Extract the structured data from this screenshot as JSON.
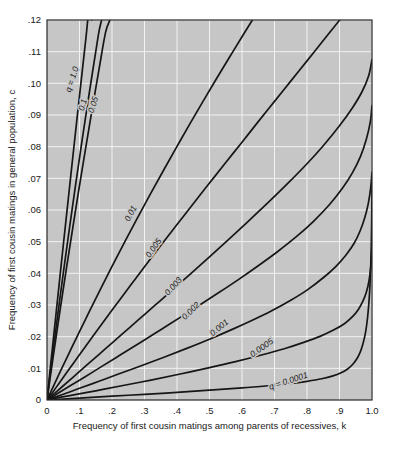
{
  "figure": {
    "title": "",
    "background_color": "#ffffff",
    "plot_background_color": "#c6c6c6",
    "gridline_color": "#f2f2f2",
    "curve_color": "#161616"
  },
  "chart_data": {
    "type": "line",
    "title": "",
    "subtitle": "",
    "xlabel": "Frequency of first cousin matings among parents of recessives, k",
    "ylabel": "Frequency of first cousin matings in general population, c",
    "xlim": [
      0,
      1.0
    ],
    "ylim": [
      0,
      0.12
    ],
    "grid": true,
    "legend_position": "inline-curve-labels",
    "x_ticks": [
      0,
      0.1,
      0.2,
      0.3,
      0.4,
      0.5,
      0.6,
      0.7,
      0.8,
      0.9,
      1.0
    ],
    "x_tick_labels": [
      "0",
      ".1",
      ".2",
      ".3",
      ".4",
      ".5",
      ".6",
      ".7",
      ".8",
      ".9",
      "1.0"
    ],
    "y_ticks": [
      0,
      0.01,
      0.02,
      0.03,
      0.04,
      0.05,
      0.06,
      0.07,
      0.08,
      0.09,
      0.1,
      0.11,
      0.12
    ],
    "y_tick_labels": [
      "0",
      ".01",
      ".02",
      ".03",
      ".04",
      ".05",
      ".06",
      ".07",
      ".08",
      ".09",
      ".10",
      ".11",
      ".12"
    ],
    "series": [
      {
        "name": "q = 1.0",
        "q": 1.0,
        "label": "q = 1.0",
        "label_x": 0.085,
        "label_y": 0.101,
        "label_rotation": -72,
        "points": [
          [
            0.0,
            0.0
          ],
          [
            0.002,
            0.00198
          ],
          [
            0.005,
            0.00495
          ],
          [
            0.01,
            0.0099
          ],
          [
            0.02,
            0.0197
          ],
          [
            0.03,
            0.0294
          ],
          [
            0.04,
            0.0391
          ],
          [
            0.05,
            0.0488
          ],
          [
            0.06,
            0.0583
          ],
          [
            0.07,
            0.0678
          ],
          [
            0.08,
            0.0773
          ],
          [
            0.09,
            0.0867
          ],
          [
            0.1,
            0.096
          ],
          [
            0.11,
            0.1053
          ],
          [
            0.12,
            0.1145
          ],
          [
            0.13,
            0.1236
          ],
          [
            0.1372,
            0.12
          ]
        ]
      },
      {
        "name": "0.1",
        "q": 0.1,
        "label": "0.1",
        "label_x": 0.118,
        "label_y": 0.093,
        "label_rotation": -74,
        "points": [
          [
            0.0,
            0.0
          ],
          [
            0.005,
            0.0042
          ],
          [
            0.01,
            0.00835
          ],
          [
            0.02,
            0.0165
          ],
          [
            0.03,
            0.0245
          ],
          [
            0.04,
            0.0323
          ],
          [
            0.05,
            0.04
          ],
          [
            0.06,
            0.0475
          ],
          [
            0.07,
            0.0549
          ],
          [
            0.08,
            0.0622
          ],
          [
            0.09,
            0.0694
          ],
          [
            0.1,
            0.0764
          ],
          [
            0.11,
            0.0834
          ],
          [
            0.12,
            0.0902
          ],
          [
            0.13,
            0.0969
          ],
          [
            0.14,
            0.1035
          ],
          [
            0.15,
            0.11
          ],
          [
            0.16,
            0.1164
          ],
          [
            0.168,
            0.12
          ]
        ]
      },
      {
        "name": "0.05",
        "q": 0.05,
        "label": "0.05",
        "label_x": 0.15,
        "label_y": 0.093,
        "label_rotation": -72,
        "points": [
          [
            0.0,
            0.0
          ],
          [
            0.005,
            0.0036
          ],
          [
            0.01,
            0.0072
          ],
          [
            0.02,
            0.0143
          ],
          [
            0.03,
            0.0213
          ],
          [
            0.04,
            0.0282
          ],
          [
            0.05,
            0.035
          ],
          [
            0.06,
            0.0417
          ],
          [
            0.07,
            0.0483
          ],
          [
            0.08,
            0.0548
          ],
          [
            0.09,
            0.0613
          ],
          [
            0.1,
            0.0677
          ],
          [
            0.12,
            0.0802
          ],
          [
            0.14,
            0.0925
          ],
          [
            0.16,
            0.1044
          ],
          [
            0.18,
            0.116
          ],
          [
            0.1935,
            0.12
          ]
        ]
      },
      {
        "name": "0.01",
        "q": 0.01,
        "label": "0.01",
        "label_x": 0.265,
        "label_y": 0.0585,
        "label_rotation": -62,
        "points": [
          [
            0.0,
            0.0
          ],
          [
            0.01,
            0.0022
          ],
          [
            0.02,
            0.0044
          ],
          [
            0.04,
            0.0088
          ],
          [
            0.06,
            0.0131
          ],
          [
            0.08,
            0.0174
          ],
          [
            0.1,
            0.0216
          ],
          [
            0.13,
            0.0279
          ],
          [
            0.16,
            0.0341
          ],
          [
            0.2,
            0.0422
          ],
          [
            0.24,
            0.0501
          ],
          [
            0.28,
            0.0578
          ],
          [
            0.32,
            0.0654
          ],
          [
            0.36,
            0.0728
          ],
          [
            0.4,
            0.0801
          ],
          [
            0.44,
            0.0873
          ],
          [
            0.48,
            0.0943
          ],
          [
            0.52,
            0.1012
          ],
          [
            0.56,
            0.108
          ],
          [
            0.6,
            0.1147
          ],
          [
            0.632,
            0.12
          ]
        ]
      },
      {
        "name": "0.005",
        "q": 0.005,
        "label": "0.005",
        "label_x": 0.335,
        "label_y": 0.0475,
        "label_rotation": -55,
        "points": [
          [
            0.0,
            0.0
          ],
          [
            0.02,
            0.0028
          ],
          [
            0.04,
            0.0057
          ],
          [
            0.07,
            0.01
          ],
          [
            0.1,
            0.0143
          ],
          [
            0.14,
            0.02
          ],
          [
            0.18,
            0.0256
          ],
          [
            0.22,
            0.0311
          ],
          [
            0.26,
            0.0366
          ],
          [
            0.3,
            0.0421
          ],
          [
            0.35,
            0.0488
          ],
          [
            0.4,
            0.0554
          ],
          [
            0.45,
            0.062
          ],
          [
            0.5,
            0.0685
          ],
          [
            0.55,
            0.075
          ],
          [
            0.6,
            0.0814
          ],
          [
            0.65,
            0.0879
          ],
          [
            0.7,
            0.0943
          ],
          [
            0.75,
            0.1007
          ],
          [
            0.8,
            0.1071
          ],
          [
            0.85,
            0.1135
          ],
          [
            0.9,
            0.1199
          ],
          [
            0.901,
            0.12
          ]
        ]
      },
      {
        "name": "0.003",
        "q": 0.003,
        "label": "0.003",
        "label_x": 0.395,
        "label_y": 0.0353,
        "label_rotation": -48,
        "points": [
          [
            0.0,
            0.0
          ],
          [
            0.02,
            0.0018
          ],
          [
            0.05,
            0.0045
          ],
          [
            0.09,
            0.0081
          ],
          [
            0.13,
            0.0117
          ],
          [
            0.18,
            0.0162
          ],
          [
            0.23,
            0.0207
          ],
          [
            0.28,
            0.0252
          ],
          [
            0.33,
            0.0297
          ],
          [
            0.38,
            0.0342
          ],
          [
            0.44,
            0.0397
          ],
          [
            0.5,
            0.0452
          ],
          [
            0.56,
            0.0508
          ],
          [
            0.62,
            0.0565
          ],
          [
            0.68,
            0.0623
          ],
          [
            0.74,
            0.0683
          ],
          [
            0.8,
            0.0746
          ],
          [
            0.85,
            0.0803
          ],
          [
            0.9,
            0.0866
          ],
          [
            0.94,
            0.0923
          ],
          [
            0.97,
            0.0975
          ],
          [
            0.99,
            0.1025
          ],
          [
            1.0,
            0.1075
          ]
        ]
      },
      {
        "name": "0.002",
        "q": 0.002,
        "label": "0.002",
        "label_x": 0.448,
        "label_y": 0.0275,
        "label_rotation": -44,
        "points": [
          [
            0.0,
            0.0
          ],
          [
            0.03,
            0.0019
          ],
          [
            0.07,
            0.0044
          ],
          [
            0.12,
            0.0075
          ],
          [
            0.17,
            0.0107
          ],
          [
            0.23,
            0.0145
          ],
          [
            0.29,
            0.0183
          ],
          [
            0.35,
            0.0222
          ],
          [
            0.41,
            0.0261
          ],
          [
            0.47,
            0.03
          ],
          [
            0.53,
            0.034
          ],
          [
            0.59,
            0.0381
          ],
          [
            0.65,
            0.0424
          ],
          [
            0.71,
            0.0469
          ],
          [
            0.77,
            0.0518
          ],
          [
            0.82,
            0.0564
          ],
          [
            0.87,
            0.0618
          ],
          [
            0.91,
            0.067
          ],
          [
            0.94,
            0.0718
          ],
          [
            0.965,
            0.077
          ],
          [
            0.983,
            0.0825
          ],
          [
            0.995,
            0.088
          ],
          [
            1.0,
            0.093
          ]
        ]
      },
      {
        "name": "0.001",
        "q": 0.001,
        "label": "0.001",
        "label_x": 0.535,
        "label_y": 0.0222,
        "label_rotation": -40,
        "points": [
          [
            0.0,
            0.0
          ],
          [
            0.05,
            0.0018
          ],
          [
            0.1,
            0.0037
          ],
          [
            0.16,
            0.0059
          ],
          [
            0.22,
            0.0082
          ],
          [
            0.29,
            0.0108
          ],
          [
            0.36,
            0.0135
          ],
          [
            0.43,
            0.0163
          ],
          [
            0.5,
            0.0192
          ],
          [
            0.57,
            0.0223
          ],
          [
            0.63,
            0.0251
          ],
          [
            0.69,
            0.0281
          ],
          [
            0.75,
            0.0315
          ],
          [
            0.8,
            0.0347
          ],
          [
            0.85,
            0.0386
          ],
          [
            0.89,
            0.0423
          ],
          [
            0.92,
            0.0458
          ],
          [
            0.945,
            0.0495
          ],
          [
            0.963,
            0.0533
          ],
          [
            0.977,
            0.0573
          ],
          [
            0.988,
            0.0618
          ],
          [
            0.996,
            0.067
          ],
          [
            1.0,
            0.072
          ]
        ]
      },
      {
        "name": "0.0005",
        "q": 0.0005,
        "label": "0.0005",
        "label_x": 0.665,
        "label_y": 0.0158,
        "label_rotation": -35,
        "points": [
          [
            0.0,
            0.0
          ],
          [
            0.07,
            0.0014
          ],
          [
            0.15,
            0.0029
          ],
          [
            0.23,
            0.0045
          ],
          [
            0.32,
            0.0063
          ],
          [
            0.41,
            0.0082
          ],
          [
            0.5,
            0.0102
          ],
          [
            0.58,
            0.0121
          ],
          [
            0.66,
            0.0142
          ],
          [
            0.73,
            0.0162
          ],
          [
            0.79,
            0.0182
          ],
          [
            0.84,
            0.0201
          ],
          [
            0.88,
            0.022
          ],
          [
            0.915,
            0.0241
          ],
          [
            0.94,
            0.0263
          ],
          [
            0.958,
            0.0286
          ],
          [
            0.972,
            0.0312
          ],
          [
            0.983,
            0.0342
          ],
          [
            0.991,
            0.0378
          ],
          [
            0.996,
            0.0418
          ],
          [
            0.999,
            0.0462
          ],
          [
            1.0,
            0.05
          ]
        ]
      },
      {
        "name": "q = 0.0001",
        "q": 0.0001,
        "label": "q = 0.0001",
        "label_x": 0.745,
        "label_y": 0.0052,
        "label_rotation": -18,
        "points": [
          [
            0.0,
            0.0
          ],
          [
            0.1,
            0.0006
          ],
          [
            0.2,
            0.0012
          ],
          [
            0.3,
            0.0018
          ],
          [
            0.4,
            0.0024
          ],
          [
            0.5,
            0.0031
          ],
          [
            0.6,
            0.0038
          ],
          [
            0.68,
            0.0045
          ],
          [
            0.75,
            0.0052
          ],
          [
            0.8,
            0.0059
          ],
          [
            0.845,
            0.0067
          ],
          [
            0.88,
            0.0076
          ],
          [
            0.905,
            0.0086
          ],
          [
            0.925,
            0.0098
          ],
          [
            0.941,
            0.0113
          ],
          [
            0.954,
            0.0131
          ],
          [
            0.964,
            0.0152
          ],
          [
            0.972,
            0.0177
          ],
          [
            0.979,
            0.0207
          ],
          [
            0.984,
            0.024
          ],
          [
            0.988,
            0.0278
          ],
          [
            0.9915,
            0.0322
          ],
          [
            0.994,
            0.037
          ],
          [
            0.9962,
            0.0425
          ],
          [
            0.9978,
            0.0487
          ],
          [
            0.999,
            0.0555
          ],
          [
            0.9997,
            0.063
          ],
          [
            1.0,
            0.07
          ]
        ]
      }
    ]
  }
}
